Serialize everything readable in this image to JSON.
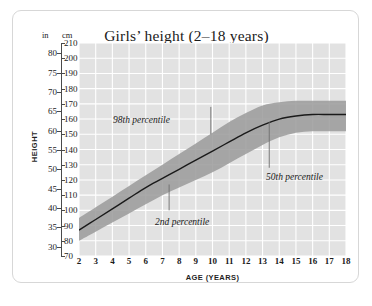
{
  "chart": {
    "title": "Girls’ height (2–18 years)",
    "y_unit_left": "in",
    "y_unit_right": "cm",
    "y_axis_label": "HEIGHT",
    "x_axis_label": "AGE (YEARS)",
    "annotations": {
      "upper": "98th percentile",
      "lower": "2nd percentile",
      "median": "50th percentile"
    }
  },
  "chart_data": {
    "type": "line",
    "title": "Girls’ height (2–18 years)",
    "xlabel": "AGE (YEARS)",
    "ylabel": "HEIGHT",
    "grid": true,
    "legend": "inline-annotations",
    "xlim": [
      2,
      18
    ],
    "ylim_cm": [
      70,
      210
    ],
    "ylim_in": [
      27.6,
      82.7
    ],
    "x_ticks": [
      2,
      3,
      4,
      5,
      6,
      7,
      8,
      9,
      10,
      11,
      12,
      13,
      14,
      15,
      16,
      17,
      18
    ],
    "y_ticks_cm": [
      70,
      80,
      90,
      100,
      110,
      120,
      130,
      140,
      150,
      160,
      170,
      180,
      190,
      200,
      210
    ],
    "y_ticks_in": [
      30,
      35,
      40,
      45,
      50,
      55,
      60,
      65,
      70,
      75,
      80
    ],
    "x": [
      2,
      3,
      4,
      5,
      6,
      7,
      8,
      9,
      10,
      11,
      12,
      13,
      14,
      15,
      16,
      17,
      18
    ],
    "series": [
      {
        "name": "2nd percentile",
        "unit": "cm",
        "values": [
          80,
          86,
          92,
          98,
          104,
          110,
          115,
          120,
          125,
          131,
          137,
          143,
          148,
          151,
          152,
          152,
          152
        ]
      },
      {
        "name": "50th percentile",
        "unit": "cm",
        "values": [
          87,
          94,
          101,
          108,
          115,
          121,
          127,
          133,
          139,
          145,
          151,
          156,
          160,
          162,
          163,
          163,
          163
        ]
      },
      {
        "name": "98th percentile",
        "unit": "cm",
        "values": [
          95,
          102,
          109,
          116,
          123,
          130,
          137,
          144,
          151,
          158,
          164,
          169,
          171,
          172,
          172,
          172,
          172
        ]
      }
    ],
    "band": {
      "name": "2nd–98th percentile range",
      "lower_series": "2nd percentile",
      "upper_series": "98th percentile",
      "color": "#9a9a9a"
    },
    "median_line_color": "#1a1a1a",
    "plot_background": "#e2e2e2",
    "gridline_color": "#ffffff"
  }
}
